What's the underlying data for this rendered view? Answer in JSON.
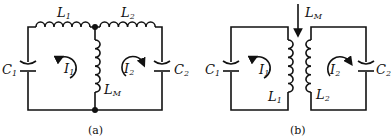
{
  "figure": {
    "panel_a": {
      "caption": "(a)",
      "labels": {
        "L1": {
          "main": "L",
          "sub": "1"
        },
        "L2": {
          "main": "L",
          "sub": "2"
        },
        "C1": {
          "main": "C",
          "sub": "1"
        },
        "C2": {
          "main": "C",
          "sub": "2"
        },
        "I1": {
          "main": "I",
          "sub": "1"
        },
        "I2": {
          "main": "I",
          "sub": "2"
        },
        "LM": {
          "main": "L",
          "sub": "M"
        }
      }
    },
    "panel_b": {
      "caption": "(b)",
      "labels": {
        "LM": {
          "main": "L",
          "sub": "M"
        },
        "C1": {
          "main": "C",
          "sub": "1"
        },
        "C2": {
          "main": "C",
          "sub": "2"
        },
        "I1": {
          "main": "I",
          "sub": "1"
        },
        "I2": {
          "main": "I",
          "sub": "2"
        },
        "L1": {
          "main": "L",
          "sub": "1"
        },
        "L2": {
          "main": "L",
          "sub": "2"
        }
      }
    }
  }
}
